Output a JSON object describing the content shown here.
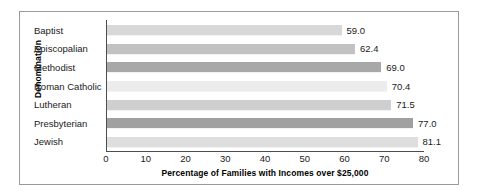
{
  "chart_data": {
    "type": "bar",
    "orientation": "horizontal",
    "title": "",
    "xlabel": "Percentage of Families with Incomes over $25,000",
    "ylabel": "Denomination",
    "categories": [
      "Baptist",
      "Episcopalian",
      "Methodist",
      "Roman Catholic",
      "Lutheran",
      "Presbyterian",
      "Jewish"
    ],
    "values": [
      59.0,
      62.4,
      69.0,
      70.4,
      71.5,
      77.0,
      81.1
    ],
    "value_labels": [
      "59.0",
      "62.4",
      "69.0",
      "70.4",
      "71.5",
      "77.0",
      "81.1"
    ],
    "xlim": [
      0,
      80
    ],
    "xticks": [
      0,
      10,
      20,
      30,
      40,
      50,
      60,
      70,
      80
    ],
    "xtick_labels": [
      "0",
      "10",
      "20",
      "30",
      "40",
      "50",
      "60",
      "70",
      "80"
    ],
    "grid": false,
    "legend": null,
    "bar_colors": [
      "#d8d8d8",
      "#c2c2c2",
      "#a8a8a8",
      "#ececec",
      "#cfcfcf",
      "#a0a0a0",
      "#dedede"
    ],
    "axis_color": "#4d4d4d",
    "frame_color": "#9a9a9a",
    "background": "#ffffff"
  }
}
